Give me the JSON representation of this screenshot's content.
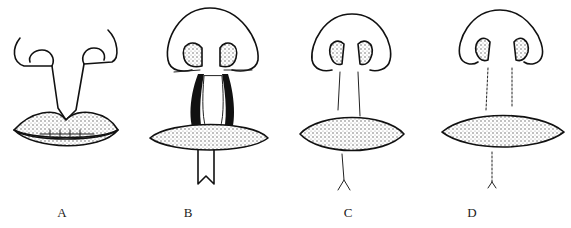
{
  "figure": {
    "panels": [
      {
        "id": "A",
        "label": "A",
        "stage": "cleft with incision lines"
      },
      {
        "id": "B",
        "label": "B",
        "stage": "flaps raised, nostril sutures, Z-incision below lip"
      },
      {
        "id": "C",
        "label": "C",
        "stage": "flap rotated and sutured"
      },
      {
        "id": "D",
        "label": "D",
        "stage": "repaired lip with suture lines"
      }
    ]
  },
  "colors": {
    "line": "#111111",
    "background": "#ffffff",
    "label": "#222222"
  }
}
